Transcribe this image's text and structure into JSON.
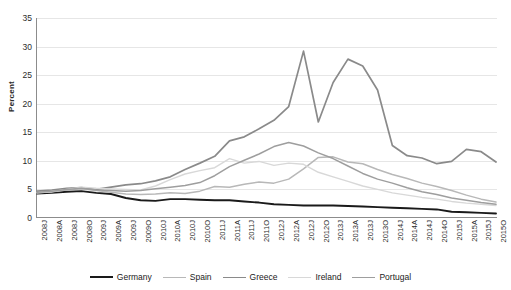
{
  "chart_data": {
    "type": "line",
    "title": "",
    "xlabel": "",
    "ylabel": "Percent",
    "ylim": [
      0,
      35
    ],
    "ytick_values": [
      0,
      5,
      10,
      15,
      20,
      25,
      30,
      35
    ],
    "grid": true,
    "legend_position": "bottom",
    "categories": [
      "2008J",
      "2008A",
      "2008J",
      "2008O",
      "2009J",
      "2009A",
      "2009J",
      "2009O",
      "2010J",
      "2010A",
      "2010J",
      "2010O",
      "2011J",
      "2011A",
      "2011J",
      "2011O",
      "2012J",
      "2012A",
      "2012J",
      "2012O",
      "2013J",
      "2013A",
      "2013J",
      "2013O",
      "2014J",
      "2014A",
      "2014J",
      "2014O",
      "2015J",
      "2015A",
      "2015J",
      "2015O"
    ],
    "series": [
      {
        "name": "Germany",
        "color": "#1a1a1a",
        "width": 1.9,
        "values": [
          4.3,
          4.4,
          4.6,
          4.7,
          4.4,
          4.2,
          3.5,
          3.1,
          3.0,
          3.3,
          3.3,
          3.2,
          3.1,
          3.1,
          2.9,
          2.7,
          2.4,
          2.3,
          2.2,
          2.2,
          2.2,
          2.1,
          2.0,
          1.9,
          1.8,
          1.7,
          1.6,
          1.5,
          1.1,
          1.0,
          0.9,
          0.8
        ]
      },
      {
        "name": "Spain",
        "color": "#b8b8b8",
        "width": 1.5,
        "values": [
          4.4,
          4.6,
          4.9,
          5.1,
          4.8,
          4.5,
          4.2,
          4.1,
          4.2,
          4.4,
          4.3,
          4.7,
          5.5,
          5.4,
          5.9,
          6.3,
          6.1,
          6.8,
          8.6,
          10.6,
          10.7,
          9.8,
          9.5,
          8.5,
          7.6,
          6.9,
          6.1,
          5.5,
          4.8,
          4.0,
          3.3,
          2.8
        ]
      },
      {
        "name": "Greece",
        "color": "#8a8a8a",
        "width": 1.7,
        "values": [
          4.7,
          4.9,
          5.2,
          5.3,
          5.0,
          5.4,
          5.8,
          6.0,
          6.5,
          7.2,
          8.5,
          9.6,
          10.8,
          13.5,
          14.2,
          15.6,
          17.1,
          19.5,
          29.2,
          16.8,
          23.7,
          27.8,
          26.6,
          22.4,
          12.7,
          10.9,
          10.5,
          9.5,
          9.9,
          12.0,
          11.6,
          9.8
        ]
      },
      {
        "name": "Ireland",
        "color": "#d8d8d8",
        "width": 1.4,
        "values": [
          4.4,
          4.6,
          5.0,
          5.4,
          5.2,
          5.1,
          5.0,
          4.9,
          5.6,
          6.7,
          7.7,
          8.3,
          8.8,
          10.4,
          9.6,
          9.9,
          9.2,
          9.6,
          9.4,
          8.0,
          7.2,
          6.4,
          5.6,
          5.0,
          4.4,
          4.0,
          3.6,
          3.3,
          2.9,
          2.6,
          2.4,
          2.2
        ]
      },
      {
        "name": "Portugal",
        "color": "#9e9e9e",
        "width": 1.5,
        "values": [
          4.5,
          4.7,
          5.0,
          5.2,
          4.9,
          4.8,
          4.7,
          4.8,
          5.1,
          5.4,
          5.7,
          6.2,
          7.4,
          9.0,
          10.1,
          11.2,
          12.5,
          13.2,
          12.6,
          11.4,
          10.4,
          9.1,
          7.8,
          6.8,
          6.1,
          5.3,
          4.6,
          4.1,
          3.5,
          3.1,
          2.7,
          2.4
        ]
      }
    ]
  },
  "legend": {
    "items": [
      {
        "label": "Germany",
        "color": "#1a1a1a"
      },
      {
        "label": "Spain",
        "color": "#b8b8b8"
      },
      {
        "label": "Greece",
        "color": "#8a8a8a"
      },
      {
        "label": "Ireland",
        "color": "#d8d8d8"
      },
      {
        "label": "Portugal",
        "color": "#9e9e9e"
      }
    ]
  }
}
